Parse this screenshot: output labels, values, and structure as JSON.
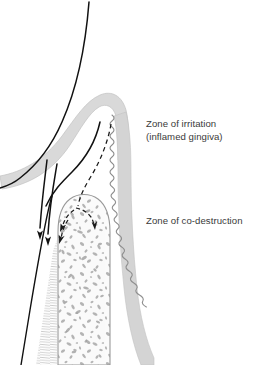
{
  "figure": {
    "background_color": "#ffffff",
    "labels": {
      "irritation_line1": "Zone of irritation",
      "irritation_line2": "(inflamed gingiva)",
      "codestruction": "Zone of co-destruction"
    },
    "label_color": "#3a3a3a",
    "anatomy": {
      "enamel_outline_name": "tooth crown enamel outline",
      "gingiva_band_name": "inflamed gingiva band",
      "gingiva_color": "#d9d9d9",
      "gingiva_outline_color": "#bcbcbc",
      "root_surface_name": "wavy cementum root surface",
      "root_band_color": "#d4d4d4",
      "alveolar_bone_name": "alveolar bone crest with trabeculae",
      "bone_fill_color": "#fbfbfb",
      "bone_outline_color": "#9a9a9a",
      "trabeculae_color": "#a8a8a8",
      "pdl_fibers_name": "periodontal ligament fiber hatching",
      "pdl_fiber_color": "#c9c9c9",
      "solid_arrow_color": "#111111",
      "dashed_arrow_color": "#1a1a1a",
      "solid_arrow_count": 2,
      "dashed_arrow_count": 3
    }
  }
}
